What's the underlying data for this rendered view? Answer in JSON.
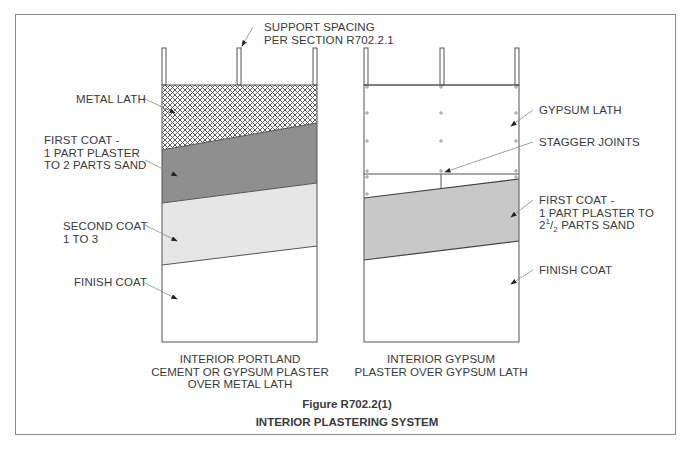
{
  "figure": {
    "number": "Figure R702.2(1)",
    "title": "INTERIOR PLASTERING SYSTEM"
  },
  "labels": {
    "support_spacing": [
      "SUPPORT SPACING",
      "PER SECTION R702.2.1"
    ],
    "left": {
      "metal_lath": "METAL LATH",
      "first_coat": [
        "FIRST COAT -",
        "1 PART PLASTER",
        "TO 2 PARTS SAND"
      ],
      "second_coat": [
        "SECOND COAT",
        "1 TO 3"
      ],
      "finish_coat": "FINISH COAT",
      "caption": [
        "INTERIOR PORTLAND",
        "CEMENT OR GYPSUM PLASTER",
        "OVER METAL LATH"
      ]
    },
    "right": {
      "gypsum_lath": "GYPSUM LATH",
      "stagger_joints": "STAGGER JOINTS",
      "first_coat": [
        "FIRST COAT -",
        "1 PART PLASTER TO"
      ],
      "first_coat_ratio": {
        "whole": "2",
        "num": "1",
        "den": "2",
        "rest": " PARTS SAND"
      },
      "finish_coat": "FINISH COAT",
      "caption": [
        "INTERIOR GYPSUM",
        "PLASTER OVER GYPSUM LATH"
      ]
    }
  },
  "colors": {
    "frame": "#8a8a8a",
    "line": "#555555",
    "first_coat_left": "#8f8f8f",
    "second_coat_left": "#e6e6e6",
    "first_coat_right": "#c8c8c8",
    "lath_hatch": "#6a6a6a"
  }
}
